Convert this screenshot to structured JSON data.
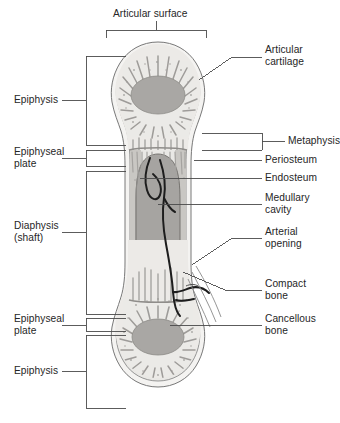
{
  "colors": {
    "ink": "#2b2b2b",
    "leader": "#4a4a4a",
    "outline": "#6f6f6f",
    "periosteum_fill": "#f2f1ef",
    "compact_fill": "#cfcdc9",
    "cancellous_fill": "#e8e7e4",
    "marrow_fill": "#a6a4a1",
    "epiphysis_core": "#a9a7a4",
    "vessel": "#1d1d1d",
    "page_bg": "#ffffff"
  },
  "labels": {
    "articular_surface": "Articular surface",
    "articular_cartilage": "Articular\ncartilage",
    "epiphysis_top": "Epiphysis",
    "epiphyseal_plate_top": "Epiphyseal\nplate",
    "metaphysis": "Metaphysis",
    "periosteum": "Periosteum",
    "endosteum": "Endosteum",
    "medullary_cavity": "Medullary\ncavity",
    "diaphysis": "Diaphysis\n(shaft)",
    "arterial_opening": "Arterial\nopening",
    "compact_bone": "Compact\nbone",
    "cancellous_bone": "Cancellous\nbone",
    "epiphyseal_plate_bottom": "Epiphyseal\nplate",
    "epiphysis_bottom": "Epiphysis"
  },
  "callouts": [
    {
      "name": "articular-surface",
      "side": "top",
      "bracket": true
    },
    {
      "name": "articular-cartilage",
      "side": "right",
      "bracket": false
    },
    {
      "name": "epiphysis-top",
      "side": "left",
      "bracket": true
    },
    {
      "name": "epiphyseal-plate-top",
      "side": "left",
      "bracket": true
    },
    {
      "name": "metaphysis",
      "side": "right",
      "bracket": true
    },
    {
      "name": "periosteum",
      "side": "right",
      "bracket": false
    },
    {
      "name": "endosteum",
      "side": "right",
      "bracket": false
    },
    {
      "name": "medullary-cavity",
      "side": "right",
      "bracket": false
    },
    {
      "name": "diaphysis",
      "side": "left",
      "bracket": true
    },
    {
      "name": "arterial-opening",
      "side": "right",
      "bracket": false
    },
    {
      "name": "compact-bone",
      "side": "right",
      "bracket": false
    },
    {
      "name": "cancellous-bone",
      "side": "right",
      "bracket": false
    },
    {
      "name": "epiphyseal-plate-bottom",
      "side": "left",
      "bracket": true
    },
    {
      "name": "epiphysis-bottom",
      "side": "left",
      "bracket": true
    }
  ]
}
